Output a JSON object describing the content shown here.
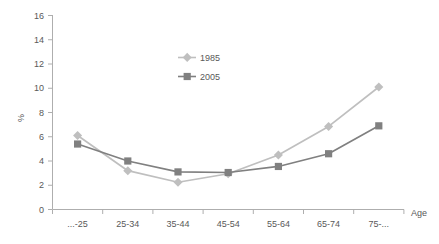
{
  "chart_data": {
    "type": "line",
    "title": "",
    "xlabel": "Age",
    "ylabel": "%",
    "categories": [
      "...-25",
      "25-34",
      "35-44",
      "45-54",
      "55-64",
      "65-74",
      "75-..."
    ],
    "ylim": [
      0,
      16
    ],
    "yticks": [
      0,
      2,
      4,
      6,
      8,
      10,
      12,
      14,
      16
    ],
    "grid": false,
    "legend_position": "upper-center",
    "series": [
      {
        "name": "1985",
        "color": "#bfbfbf",
        "marker": "diamond",
        "values": [
          6.1,
          3.2,
          2.25,
          2.95,
          4.5,
          6.85,
          10.1
        ]
      },
      {
        "name": "2005",
        "color": "#808080",
        "marker": "square",
        "values": [
          5.4,
          4.0,
          3.1,
          3.05,
          3.55,
          4.6,
          6.9
        ]
      }
    ]
  },
  "axes": {
    "y_axis_title": "%",
    "x_axis_title": "Age",
    "y_tick_labels": [
      "0",
      "2",
      "4",
      "6",
      "8",
      "10",
      "12",
      "14",
      "16"
    ],
    "x_tick_labels": [
      "...-25",
      "25-34",
      "35-44",
      "45-54",
      "55-64",
      "65-74",
      "75-..."
    ]
  },
  "legend": {
    "entries": [
      {
        "label": "1985"
      },
      {
        "label": "2005"
      }
    ]
  },
  "colors": {
    "series_1985": "#bfbfbf",
    "series_2005": "#808080",
    "axis": "#aeaeae",
    "text": "#595959",
    "background": "#ffffff"
  }
}
